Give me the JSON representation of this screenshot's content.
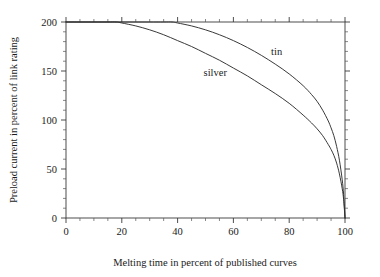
{
  "chart_data": {
    "type": "line",
    "title": "",
    "xlabel": "Melting time in percent of published curves",
    "ylabel": "Preload current in percent of link rating",
    "xlim": [
      0,
      100
    ],
    "ylim": [
      0,
      200
    ],
    "grid": false,
    "legend_position": "inline-annotations",
    "x_ticks": [
      0,
      20,
      40,
      60,
      80,
      100
    ],
    "x_tick_labels": [
      "0",
      "20",
      "40",
      "60",
      "80",
      "100"
    ],
    "x_minor_step": 5,
    "y_ticks": [
      0,
      50,
      100,
      150,
      200
    ],
    "y_tick_labels": [
      "0",
      "50",
      "100",
      "150",
      "200"
    ],
    "y_minor_step": 10,
    "annotations": [
      {
        "text": "tin",
        "x": 75.5,
        "y": 166
      },
      {
        "text": "silver",
        "x": 53.5,
        "y": 145
      }
    ],
    "series": [
      {
        "name": "tin",
        "color": "#2e2e2e",
        "x": [
          0,
          5,
          10,
          15,
          20,
          25,
          30,
          35,
          38,
          40,
          45,
          50,
          55,
          60,
          65,
          70,
          75,
          80,
          85,
          88,
          90,
          92,
          94,
          95,
          96,
          97,
          98,
          99,
          99.5,
          100
        ],
        "y": [
          200,
          200,
          200,
          200,
          200,
          200,
          200,
          200,
          200,
          199,
          196,
          192,
          187,
          181,
          174,
          166,
          157,
          147,
          135,
          126,
          119,
          110,
          99,
          92,
          84,
          73,
          59,
          39,
          24,
          0
        ]
      },
      {
        "name": "silver",
        "color": "#2e2e2e",
        "x": [
          0,
          5,
          10,
          15,
          18,
          20,
          25,
          30,
          35,
          40,
          45,
          50,
          55,
          60,
          65,
          70,
          75,
          80,
          85,
          88,
          90,
          92,
          94,
          95,
          96,
          97,
          98,
          99,
          99.5,
          100
        ],
        "y": [
          200,
          200,
          200,
          200,
          200,
          199,
          196,
          192,
          187,
          181,
          175,
          168,
          161,
          153,
          145,
          136,
          127,
          117,
          105,
          97,
          91,
          84,
          75,
          70,
          64,
          56,
          45,
          30,
          19,
          0
        ]
      }
    ]
  },
  "figure": {
    "background_color": "#ffffff",
    "axis_color": "#3a3a3a",
    "line_color": "#2e2e2e",
    "text_color": "#1a1a1a"
  }
}
